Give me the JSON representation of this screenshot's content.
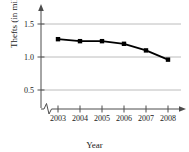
{
  "chart_data": {
    "type": "line",
    "title": "",
    "xlabel": "Year",
    "ylabel": "Thefts (in millions)",
    "categories": [
      "2003",
      "2004",
      "2005",
      "2006",
      "2007",
      "2008"
    ],
    "x": [
      2003,
      2004,
      2005,
      2006,
      2007,
      2008
    ],
    "values": [
      1.27,
      1.24,
      1.24,
      1.2,
      1.1,
      0.96
    ],
    "series": [
      {
        "name": "Thefts",
        "values": [
          1.27,
          1.24,
          1.24,
          1.2,
          1.1,
          0.96
        ]
      }
    ],
    "xlim": [
      2003,
      2008
    ],
    "ylim": [
      0.0,
      1.65
    ],
    "yticks": [
      0.5,
      1.0,
      1.5
    ],
    "ytick_labels": [
      "0.5",
      "1.0",
      "1.5"
    ],
    "xtick_labels": [
      "2003",
      "2004",
      "2005",
      "2006",
      "2007",
      "2008"
    ],
    "grid": "horizontal",
    "legend": "none",
    "axis_break": "x-axis zigzag break between origin and 2003",
    "marker": "filled-square",
    "line_color": "#000000",
    "grid_color": "#b8b8b8",
    "axis_color": "#555555"
  }
}
